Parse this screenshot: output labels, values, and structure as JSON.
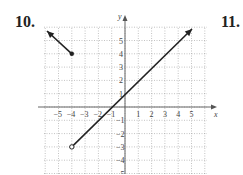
{
  "problems": {
    "left": "10.",
    "right": "11."
  },
  "chart_data": {
    "type": "line",
    "title": "",
    "xlabel": "x",
    "ylabel": "y",
    "xlim": [
      -6,
      6
    ],
    "ylim": [
      -5,
      6
    ],
    "grid": true,
    "x_ticks": [
      "-5",
      "-4",
      "-3",
      "-2",
      "-1",
      "1",
      "2",
      "3",
      "4",
      "5"
    ],
    "y_ticks": [
      "5",
      "4",
      "3",
      "2",
      "1",
      "-1",
      "-2",
      "-3",
      "-4",
      "-5"
    ],
    "series": [
      {
        "name": "piece-1",
        "points": [
          [
            -4,
            4
          ],
          [
            -6,
            6
          ]
        ],
        "start": "closed-dot",
        "end": "arrow"
      },
      {
        "name": "piece-2",
        "points": [
          [
            -4,
            -3
          ],
          [
            5,
            6
          ]
        ],
        "start": "open-dot",
        "end": "arrow",
        "equation": "y = x + 1"
      }
    ],
    "colors": {
      "line": "#222222",
      "grid": "#9a9a9a",
      "axis": "#555555"
    }
  }
}
